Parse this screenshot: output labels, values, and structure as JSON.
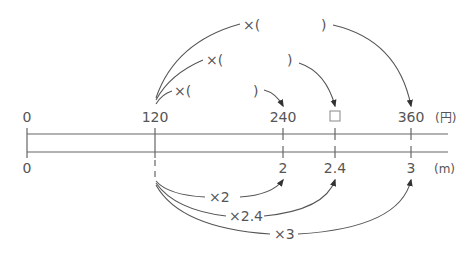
{
  "diagram": {
    "type": "double-number-line",
    "top_line": {
      "unit": "(円)",
      "ticks": [
        {
          "label": "0",
          "x": 27
        },
        {
          "label": "120",
          "x": 155
        },
        {
          "label": "240",
          "x": 283
        },
        {
          "label": "□",
          "x": 335
        },
        {
          "label": "360",
          "x": 411
        }
      ]
    },
    "bottom_line": {
      "unit": "(m)",
      "ticks": [
        {
          "label": "0",
          "x": 27
        },
        {
          "label": "",
          "x": 155
        },
        {
          "label": "2",
          "x": 283
        },
        {
          "label": "2.4",
          "x": 335
        },
        {
          "label": "3",
          "x": 411
        }
      ]
    },
    "top_arrows": [
      {
        "label_prefix": "×(",
        "label_suffix": ")",
        "target": "240"
      },
      {
        "label_prefix": "×(",
        "label_suffix": ")",
        "target": "□"
      },
      {
        "label_prefix": "×(",
        "label_suffix": ")",
        "target": "360"
      }
    ],
    "bottom_arrows": [
      {
        "label": "×2",
        "target": "2"
      },
      {
        "label": "×2.4",
        "target": "2.4"
      },
      {
        "label": "×3",
        "target": "3"
      }
    ]
  }
}
